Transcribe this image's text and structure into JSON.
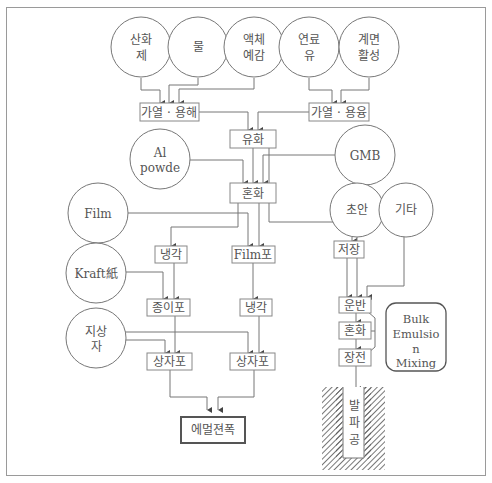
{
  "circles": {
    "oxidizer": [
      "산화",
      "제"
    ],
    "water": [
      "물"
    ],
    "liquid_sensitizer": [
      "액체",
      "예감"
    ],
    "fuel_oil": [
      "연료",
      "유"
    ],
    "surfactant": [
      "계면",
      "활성"
    ],
    "al_powder": [
      "Al",
      "powde"
    ],
    "gmb": [
      "GMB"
    ],
    "film": [
      "Film"
    ],
    "ammonium_nitrate": [
      "초안"
    ],
    "other": [
      "기타"
    ],
    "kraft": [
      "Kraft紙"
    ],
    "box": [
      "지상",
      "자"
    ]
  },
  "boxes": {
    "heat_dissolve": "가열 · 용해",
    "heat_melt": "가열 · 용융",
    "emulsify": "유화",
    "mix": "혼화",
    "cool_left": "냉각",
    "film_pack": "Film포",
    "storage": "저장",
    "paper_pack": "종이포",
    "cool_mid": "냉각",
    "transport": "운반",
    "mix_bulk": "혼화",
    "charge": "장전",
    "box_pack_left": "상자포",
    "box_pack_right": "상자포",
    "product": "에멀젼폭",
    "bulk_mixing": [
      "Bulk",
      "Emulsio",
      "n",
      "Mixing"
    ],
    "blast_hole": [
      "발",
      "파",
      "공"
    ]
  }
}
